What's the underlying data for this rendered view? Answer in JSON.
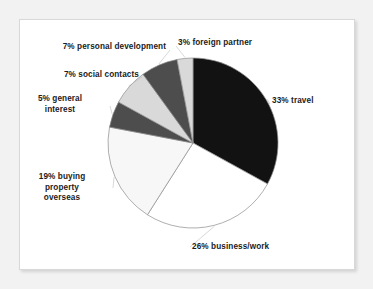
{
  "figure": {
    "background_color": "#f2f2f2",
    "panel_color": "#ffffff",
    "panel_border_color": "#d8d8d8"
  },
  "chart_data": {
    "type": "pie",
    "title": "",
    "subtitle": "",
    "xlabel": "",
    "ylabel": "",
    "grid": false,
    "legend_position": "none",
    "labels_position": "outside-callout",
    "total": 100,
    "units": "percent",
    "start_angle_deg": 0,
    "direction": "clockwise",
    "center": {
      "x": 193,
      "y": 143
    },
    "radius": 85,
    "categories": [
      "travel",
      "business/work",
      "buying property overseas",
      "general interest",
      "social contacts",
      "personal development",
      "foreign partner"
    ],
    "values": [
      33,
      26,
      19,
      5,
      7,
      7,
      3
    ],
    "slices": [
      {
        "name": "travel",
        "value": 33,
        "label": "33% travel",
        "color": "#121212",
        "start_deg": 0,
        "end_deg": 118.8
      },
      {
        "name": "business-work",
        "value": 26,
        "label": "26% business/work",
        "color": "#ffffff",
        "start_deg": 118.8,
        "end_deg": 212.4
      },
      {
        "name": "buying-property-overseas",
        "value": 19,
        "label": "19% buying\nproperty\noverseas",
        "color": "#f7f7f7",
        "start_deg": 212.4,
        "end_deg": 280.8
      },
      {
        "name": "general-interest",
        "value": 5,
        "label": "5% general\ninterest",
        "color": "#4d4d4d",
        "start_deg": 280.8,
        "end_deg": 298.8
      },
      {
        "name": "social-contacts",
        "value": 7,
        "label": "7% social contacts",
        "color": "#d9d9d9",
        "start_deg": 298.8,
        "end_deg": 324.0
      },
      {
        "name": "personal-development",
        "value": 7,
        "label": "7% personal development",
        "color": "#4d4d4d",
        "start_deg": 324.0,
        "end_deg": 349.2
      },
      {
        "name": "foreign-partner",
        "value": 3,
        "label": "3% foreign partner",
        "color": "#d9d9d9",
        "start_deg": 349.2,
        "end_deg": 360.0
      }
    ]
  },
  "labels": {
    "personal_development": "7% personal development",
    "foreign_partner": "3% foreign partner",
    "social_contacts": "7% social contacts",
    "general_interest": "5% general\ninterest",
    "travel": "33% travel",
    "buying_property_overseas": "19% buying\nproperty\noverseas",
    "business_work": "26% business/work"
  }
}
